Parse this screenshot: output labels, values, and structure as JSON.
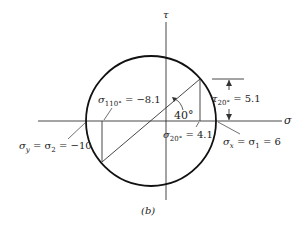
{
  "figure": {
    "caption": "(b)",
    "axes": {
      "sigma_label": "σ",
      "tau_label": "τ"
    },
    "angle_label": "40°",
    "labels": {
      "sigma_110": {
        "sym": "σ",
        "sub": "110°",
        "val": " = −8.1"
      },
      "sigma_20": {
        "sym": "σ",
        "sub": "20°",
        "val": " = 4.1"
      },
      "tau_20": {
        "sym": "τ",
        "sub": "20°",
        "val": " = 5.1"
      },
      "sigma_y": {
        "sym": "σ",
        "sub": "y",
        "mid": " = σ",
        "sub2": "2",
        "val": " = −10"
      },
      "sigma_x": {
        "sym": "σ",
        "sub": "x",
        "mid": " = σ",
        "sub2": "1",
        "val": " = 6"
      }
    },
    "colors": {
      "stroke": "#1a1a1a"
    }
  }
}
